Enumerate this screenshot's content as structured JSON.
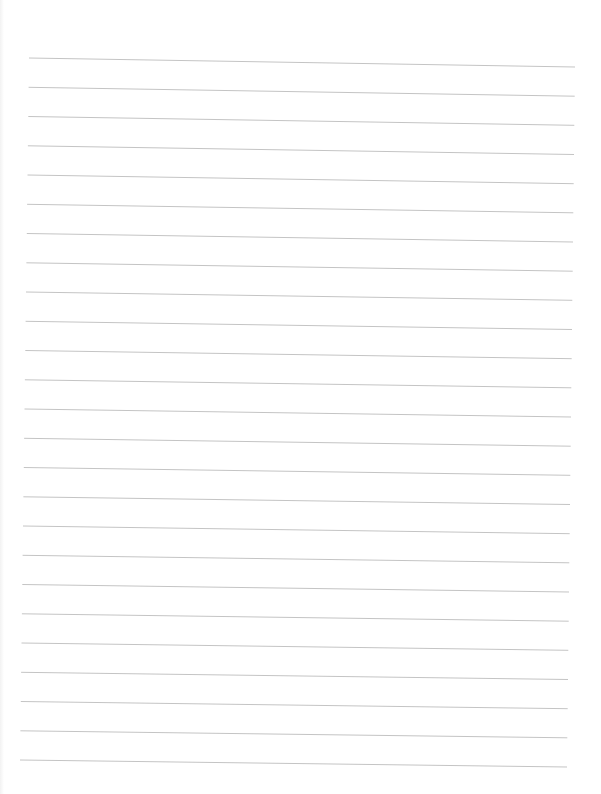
{
  "document": {
    "type": "blank ruled sheet",
    "background_color": "#ffffff",
    "line_color": "#c4c4c4",
    "line_width": 1,
    "line_count": 25,
    "first_line": {
      "x1": 29,
      "y1": 58,
      "x2": 575,
      "y2": 67
    },
    "last_line": {
      "x1": 20,
      "y1": 760,
      "x2": 567,
      "y2": 767
    },
    "text_content": []
  }
}
